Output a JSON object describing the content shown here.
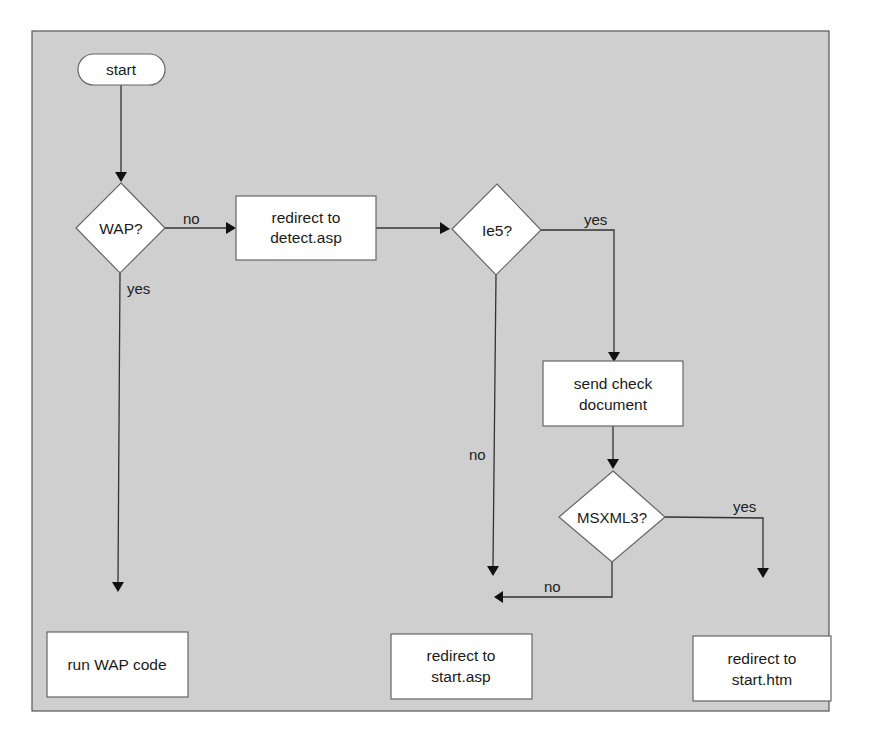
{
  "diagram": {
    "type": "flowchart",
    "nodes": {
      "start": {
        "shape": "terminator",
        "label": "start"
      },
      "wap": {
        "shape": "decision",
        "label": "WAP?"
      },
      "redirect_detect": {
        "shape": "process",
        "line1": "redirect to",
        "line2": "detect.asp"
      },
      "ie5": {
        "shape": "decision",
        "label": "Ie5?"
      },
      "send_check": {
        "shape": "process",
        "line1": "send check",
        "line2": "document"
      },
      "msxml3": {
        "shape": "decision",
        "label": "MSXML3?"
      },
      "run_wap": {
        "shape": "process",
        "label": "run WAP code"
      },
      "redirect_start_asp": {
        "shape": "process",
        "line1": "redirect to",
        "line2": "start.asp"
      },
      "redirect_start_htm": {
        "shape": "process",
        "line1": "redirect to",
        "line2": "start.htm"
      }
    },
    "edges": [
      {
        "from": "start",
        "to": "wap",
        "label": ""
      },
      {
        "from": "wap",
        "to": "redirect_detect",
        "label": "no"
      },
      {
        "from": "wap",
        "to": "run_wap",
        "label": "yes"
      },
      {
        "from": "redirect_detect",
        "to": "ie5",
        "label": ""
      },
      {
        "from": "ie5",
        "to": "send_check",
        "label": "yes"
      },
      {
        "from": "ie5",
        "to": "redirect_start_asp",
        "label": "no"
      },
      {
        "from": "send_check",
        "to": "msxml3",
        "label": ""
      },
      {
        "from": "msxml3",
        "to": "redirect_start_htm",
        "label": "yes"
      },
      {
        "from": "msxml3",
        "to": "redirect_start_asp",
        "label": "no"
      }
    ],
    "edge_labels": {
      "wap_no": "no",
      "wap_yes": "yes",
      "ie5_yes": "yes",
      "ie5_no": "no",
      "msxml3_yes": "yes",
      "msxml3_no": "no"
    },
    "colors": {
      "panel": "#cfcfcf",
      "node_fill": "#ffffff",
      "line": "#333333"
    }
  }
}
